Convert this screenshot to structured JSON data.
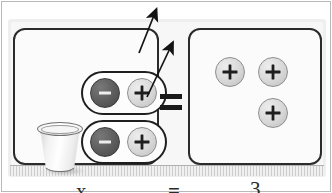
{
  "scene": {
    "title": "Algebra tiles zero-pair model",
    "description": "Two zero pairs removed from a cup, equals three positive tiles"
  },
  "colors": {
    "negative_chip": "#5c5c5c",
    "positive_chip": "#d6d6d6",
    "panel_border": "#2b2b2b",
    "mat_background": "#efefef",
    "page_background": "#ffffff"
  },
  "left_panel": {
    "name": "left-workspace",
    "cup": {
      "label": "cup",
      "icon": "paper-cup-icon"
    },
    "zero_pairs": [
      {
        "label": "zero-pair-1",
        "chips": [
          {
            "sign": "minus",
            "glyph": "−",
            "icon": "minus-chip-icon",
            "variant": "negative"
          },
          {
            "sign": "plus",
            "glyph": "+",
            "icon": "plus-chip-icon",
            "variant": "positive"
          }
        ]
      },
      {
        "label": "zero-pair-2",
        "chips": [
          {
            "sign": "minus",
            "glyph": "−",
            "icon": "minus-chip-icon",
            "variant": "negative"
          },
          {
            "sign": "plus",
            "glyph": "+",
            "icon": "plus-chip-icon",
            "variant": "positive"
          }
        ]
      }
    ]
  },
  "operator": {
    "label": "equals",
    "glyph": "="
  },
  "right_panel": {
    "name": "right-workspace",
    "chips": [
      {
        "sign": "plus",
        "glyph": "+",
        "icon": "plus-chip-icon",
        "variant": "positive"
      },
      {
        "sign": "plus",
        "glyph": "+",
        "icon": "plus-chip-icon",
        "variant": "positive"
      },
      {
        "sign": "plus",
        "glyph": "+",
        "icon": "plus-chip-icon",
        "variant": "positive"
      }
    ]
  },
  "arrows": [
    {
      "label": "remove-zero-pair-1-arrow",
      "icon": "arrow-up-right-icon"
    },
    {
      "label": "remove-zero-pair-2-arrow",
      "icon": "arrow-up-right-icon"
    }
  ],
  "equation": {
    "left_term": "x",
    "operator": "=",
    "right_term": "3"
  }
}
